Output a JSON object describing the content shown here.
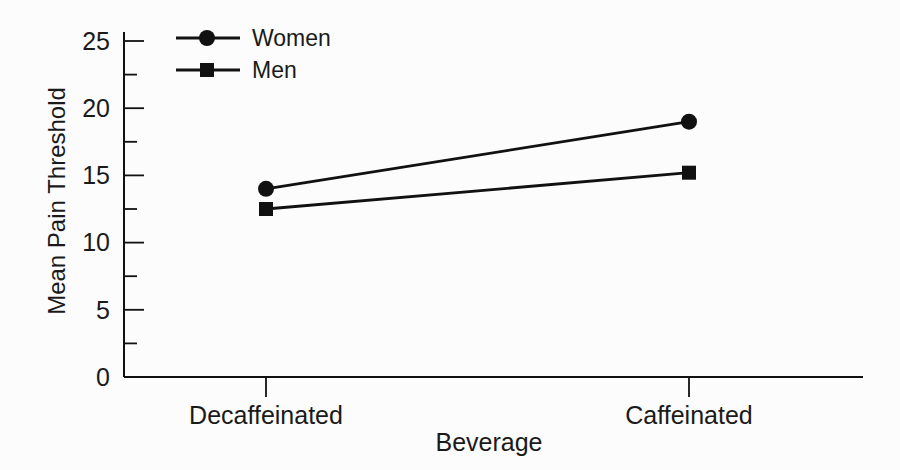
{
  "figure": {
    "background": "#fcfcfc",
    "ink_color": "#111111",
    "text_color": "#1a1a1a"
  },
  "chart_data": {
    "type": "line",
    "title": "",
    "xlabel": "Beverage",
    "ylabel": "Mean Pain Threshold",
    "categories": [
      "Decaffeinated",
      "Caffeinated"
    ],
    "series": [
      {
        "name": "Women",
        "marker": "circle",
        "values": [
          14,
          19
        ]
      },
      {
        "name": "Men",
        "marker": "square",
        "values": [
          12.5,
          15.2
        ]
      }
    ],
    "ylim": [
      0,
      25
    ],
    "yticks_major": [
      0,
      5,
      10,
      15,
      20,
      25
    ],
    "yticks_minor": [
      2.5,
      7.5,
      12.5,
      17.5,
      22.5
    ],
    "grid": false,
    "legend_position": "top-left",
    "legend_entries": [
      "Women",
      "Men"
    ],
    "line_color": "#111111"
  }
}
